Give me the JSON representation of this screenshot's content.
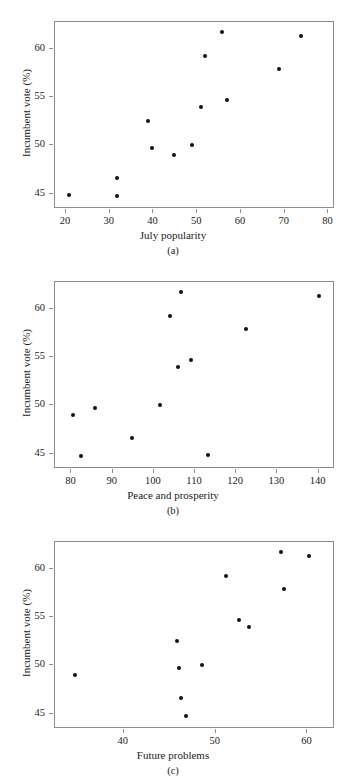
{
  "figure": {
    "ylabel": "Incumbent vote (%)",
    "ylim": [
      43.4,
      62.8
    ],
    "yticks": [
      45,
      50,
      55,
      60
    ],
    "ytick_labels": [
      "45",
      "50",
      "55",
      "60"
    ]
  },
  "panels": [
    {
      "key": "a",
      "caption": "(a)",
      "xlabel": "July popularity",
      "xticks": [
        20,
        30,
        40,
        50,
        60,
        70,
        80
      ],
      "xtick_labels": [
        "20",
        "30",
        "40",
        "50",
        "60",
        "70",
        "80"
      ]
    },
    {
      "key": "b",
      "caption": "(b)",
      "xlabel": "Peace and prosperity",
      "xticks": [
        80,
        90,
        100,
        110,
        120,
        130,
        140
      ],
      "xtick_labels": [
        "80",
        "90",
        "100",
        "110",
        "120",
        "130",
        "140"
      ]
    },
    {
      "key": "c",
      "caption": "(c)",
      "xlabel": "Future problems",
      "xticks": [
        40,
        50,
        60
      ],
      "xtick_labels": [
        "40",
        "50",
        "60"
      ]
    }
  ],
  "chart_data": [
    {
      "type": "scatter",
      "title": "",
      "xlabel": "July popularity",
      "ylabel": "Incumbent vote (%)",
      "xlim": [
        17.5,
        81.5
      ],
      "ylim": [
        43.4,
        62.8
      ],
      "xticks": [
        20,
        30,
        40,
        50,
        60,
        70,
        80
      ],
      "yticks": [
        45,
        50,
        55,
        60
      ],
      "grid": false,
      "legend": null,
      "x": [
        21.0,
        32.0,
        32.0,
        39.0,
        40.0,
        45.0,
        49.0,
        51.0,
        52.0,
        56.0,
        57.0,
        69.0,
        74.0
      ],
      "y": [
        44.7,
        46.5,
        44.6,
        52.4,
        49.6,
        48.9,
        49.9,
        53.9,
        59.2,
        61.7,
        54.6,
        57.8,
        61.2
      ]
    },
    {
      "type": "scatter",
      "title": "",
      "xlabel": "Peace and prosperity",
      "ylabel": "Incumbent vote (%)",
      "xlim": [
        76.0,
        144.0
      ],
      "ylim": [
        43.4,
        62.8
      ],
      "xticks": [
        80,
        90,
        100,
        110,
        120,
        130,
        140
      ],
      "yticks": [
        45,
        50,
        55,
        60
      ],
      "grid": false,
      "legend": null,
      "x": [
        80.5,
        82.5,
        86.0,
        95.0,
        101.8,
        104.2,
        106.2,
        106.8,
        109.3,
        113.5,
        122.7,
        140.3
      ],
      "y": [
        48.9,
        44.6,
        49.6,
        46.5,
        49.9,
        59.2,
        53.9,
        61.7,
        54.6,
        44.7,
        57.8,
        61.2
      ]
    },
    {
      "type": "scatter",
      "title": "",
      "xlabel": "Future problems",
      "ylabel": "Incumbent vote (%)",
      "xlim": [
        32.5,
        63.0
      ],
      "ylim": [
        43.4,
        62.8
      ],
      "xticks": [
        40,
        50,
        60
      ],
      "yticks": [
        45,
        50,
        55,
        60
      ],
      "grid": false,
      "legend": null,
      "x": [
        34.8,
        45.9,
        46.1,
        46.3,
        46.9,
        48.6,
        51.2,
        52.7,
        53.7,
        57.2,
        57.6,
        60.3
      ],
      "y": [
        48.9,
        52.4,
        49.6,
        46.5,
        44.6,
        49.9,
        59.2,
        54.6,
        53.9,
        61.7,
        57.8,
        61.2
      ]
    }
  ]
}
